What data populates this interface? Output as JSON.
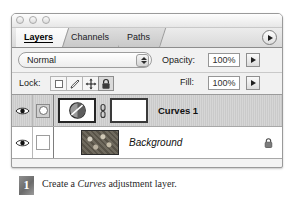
{
  "window": {
    "controls": [
      "close-button",
      "minimize-button",
      "zoom-button"
    ]
  },
  "tabs": [
    {
      "label": "Layers",
      "active": true
    },
    {
      "label": "Channels",
      "active": false
    },
    {
      "label": "Paths",
      "active": false
    }
  ],
  "panel_menu": {
    "icon": "panel-menu-triangle-icon"
  },
  "options": {
    "blend_mode": "Normal",
    "opacity_label": "Opacity:",
    "opacity_value": "100%",
    "fill_label": "Fill:",
    "fill_value": "100%"
  },
  "lock": {
    "label": "Lock:",
    "buttons": [
      {
        "name": "lock-transparent-pixels",
        "icon": "transparency-square-icon",
        "pressed": false
      },
      {
        "name": "lock-image-pixels",
        "icon": "brush-icon",
        "pressed": false
      },
      {
        "name": "lock-position",
        "icon": "move-arrows-icon",
        "pressed": false
      },
      {
        "name": "lock-all",
        "icon": "padlock-icon",
        "pressed": true
      }
    ]
  },
  "layers": [
    {
      "name": "Curves 1",
      "visible": true,
      "selected": true,
      "linked": true,
      "thumbnail": "curves-adjustment-icon",
      "mask_thumbnail": "layer-mask-white",
      "link_icon": "chain-link-icon",
      "locked": false
    },
    {
      "name": "Background",
      "visible": true,
      "selected": false,
      "linked": false,
      "thumbnail": "background-image-thumbnail",
      "locked": true,
      "lock_icon": "padlock-icon"
    }
  ],
  "caption": {
    "number": "1",
    "text_before": "Create a ",
    "text_emphasis": "Curves",
    "text_after": " adjustment layer."
  }
}
